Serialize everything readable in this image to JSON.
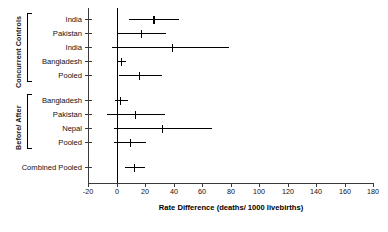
{
  "chart_data": {
    "type": "scatter",
    "subtype": "forest-plot",
    "title": "",
    "xlabel": "Rate Difference (deaths/ 1000 livebirths)",
    "ylabel": "",
    "xlim": [
      -20,
      180
    ],
    "xticks": [
      -20,
      0,
      20,
      40,
      60,
      80,
      100,
      120,
      140,
      160,
      180
    ],
    "xtick_labels": [
      "-20",
      "0",
      "20",
      "40",
      "60",
      "80",
      "100",
      "120",
      "140",
      "160",
      "180"
    ],
    "grid": false,
    "legend": "none",
    "reference_line": 0,
    "groups": [
      {
        "name": "Concurrent Controls",
        "rows": [
          {
            "label": "India",
            "estimate": 26.0,
            "ci_low": 8.5,
            "ci_high": 44.0
          },
          {
            "label": "Pakistan",
            "estimate": 17.0,
            "ci_low": 1.0,
            "ci_high": 35.0
          },
          {
            "label": "India",
            "estimate": 39.0,
            "ci_low": -3.0,
            "ci_high": 79.0
          },
          {
            "label": "Bangladesh",
            "estimate": 3.0,
            "ci_low": 0.0,
            "ci_high": 6.5
          },
          {
            "label": "Pooled",
            "estimate": 16.0,
            "ci_low": 1.5,
            "ci_high": 32.0
          }
        ]
      },
      {
        "name": "Before/ After",
        "rows": [
          {
            "label": "Bangladesh",
            "estimate": 2.5,
            "ci_low": -1.0,
            "ci_high": 8.0
          },
          {
            "label": "Pakistan",
            "estimate": 13.0,
            "ci_low": -6.5,
            "ci_high": 34.0
          },
          {
            "label": "Nepal",
            "estimate": 32.0,
            "ci_low": -1.5,
            "ci_high": 67.0
          },
          {
            "label": "Pooled",
            "estimate": 9.5,
            "ci_low": -1.5,
            "ci_high": 21.0
          }
        ]
      },
      {
        "name": "",
        "rows": [
          {
            "label": "Combined Pooled",
            "estimate": 12.5,
            "ci_low": 6.0,
            "ci_high": 20.0
          }
        ]
      }
    ],
    "colors": {
      "line": "#000000",
      "axis": "#3a3a3a",
      "background": "#ffffff"
    }
  }
}
